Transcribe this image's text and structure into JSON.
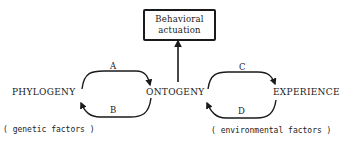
{
  "diagram": {
    "top_box": {
      "line1": "Behavioral",
      "line2": "actuation"
    },
    "nodes": {
      "left": "PHYLOGENY",
      "center": "ONTOGENY",
      "right": "EXPERIENCE"
    },
    "edges": {
      "a": "A",
      "b": "B",
      "c": "C",
      "d": "D"
    },
    "notes": {
      "left": "( genetic factors )",
      "right": "( environmental factors )"
    },
    "colors": {
      "ink": "#1a1a1a",
      "background": "#ffffff"
    }
  }
}
